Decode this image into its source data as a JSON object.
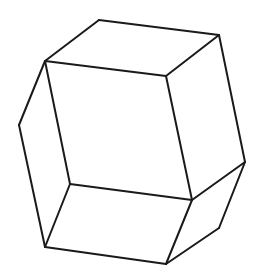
{
  "figure": {
    "type": "polyhedron-line-drawing",
    "width": 262,
    "height": 280,
    "stroke_color": "#1a1a1a",
    "background": "#ffffff",
    "vertices": {
      "A": [
        99,
        20
      ],
      "B": [
        219,
        35
      ],
      "C": [
        45,
        61
      ],
      "D": [
        166,
        76
      ],
      "E": [
        19,
        125
      ],
      "F": [
        70,
        184
      ],
      "G": [
        192,
        200
      ],
      "H": [
        245,
        162
      ],
      "I": [
        219,
        228
      ],
      "J": [
        45,
        247
      ],
      "K": [
        166,
        264
      ]
    },
    "edges": [
      [
        "A",
        "B"
      ],
      [
        "A",
        "C"
      ],
      [
        "B",
        "D"
      ],
      [
        "C",
        "D"
      ],
      [
        "B",
        "H"
      ],
      [
        "C",
        "F"
      ],
      [
        "D",
        "G"
      ],
      [
        "F",
        "G"
      ],
      [
        "C",
        "E"
      ],
      [
        "E",
        "J"
      ],
      [
        "F",
        "J"
      ],
      [
        "G",
        "H"
      ],
      [
        "H",
        "I"
      ],
      [
        "I",
        "K"
      ],
      [
        "G",
        "K"
      ],
      [
        "J",
        "K"
      ]
    ]
  }
}
